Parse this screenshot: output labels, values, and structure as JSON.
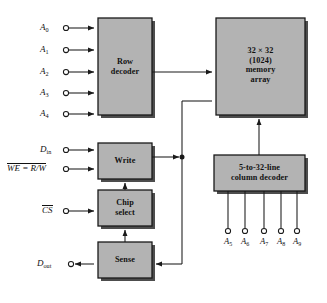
{
  "diagram": {
    "colors": {
      "block_fill": "#b3b3b3",
      "block_border": "#1a1a1a",
      "shadow": "#4d4d4d",
      "wire": "#1a1a1a",
      "background": "#ffffff"
    },
    "blocks": [
      {
        "id": "row_decoder",
        "label": "Row\ndecoder",
        "x": 98,
        "y": 18,
        "w": 54,
        "h": 97
      },
      {
        "id": "memory_array",
        "label": "32 × 32\n(1024)\nmemory\narray",
        "x": 216,
        "y": 18,
        "w": 89,
        "h": 97
      },
      {
        "id": "write",
        "label": "Write",
        "x": 98,
        "y": 143,
        "w": 54,
        "h": 36
      },
      {
        "id": "chip_select",
        "label": "Chip\nselect",
        "x": 98,
        "y": 190,
        "w": 54,
        "h": 36
      },
      {
        "id": "sense",
        "label": "Sense",
        "x": 98,
        "y": 242,
        "w": 54,
        "h": 36
      },
      {
        "id": "column_decoder",
        "label": "5-to-32-line\ncolumn decoder",
        "x": 214,
        "y": 155,
        "w": 91,
        "h": 36
      }
    ],
    "row_address_inputs": [
      {
        "name": "A0",
        "base": "A",
        "sub": "0",
        "y": 28
      },
      {
        "name": "A1",
        "base": "A",
        "sub": "1",
        "y": 50
      },
      {
        "name": "A2",
        "base": "A",
        "sub": "2",
        "y": 72
      },
      {
        "name": "A3",
        "base": "A",
        "sub": "3",
        "y": 93
      },
      {
        "name": "A4",
        "base": "A",
        "sub": "4",
        "y": 114
      }
    ],
    "control_inputs": [
      {
        "name": "Din",
        "base": "D",
        "sub": "in",
        "overline": false,
        "y": 150
      },
      {
        "name": "WE",
        "base": "WE = R/W",
        "overline": true,
        "y": 169
      },
      {
        "name": "CS",
        "base": "CS",
        "overline": true,
        "y": 211
      }
    ],
    "output": {
      "name": "Dout",
      "base": "D",
      "sub": "out",
      "y": 264
    },
    "column_address_inputs": [
      {
        "name": "A5",
        "base": "A",
        "sub": "5",
        "x": 228
      },
      {
        "name": "A6",
        "base": "A",
        "sub": "6",
        "x": 245
      },
      {
        "name": "A7",
        "base": "A",
        "sub": "7",
        "x": 264
      },
      {
        "name": "A8",
        "base": "A",
        "sub": "8",
        "x": 281
      },
      {
        "name": "A9",
        "base": "A",
        "sub": "9",
        "x": 297
      }
    ]
  }
}
